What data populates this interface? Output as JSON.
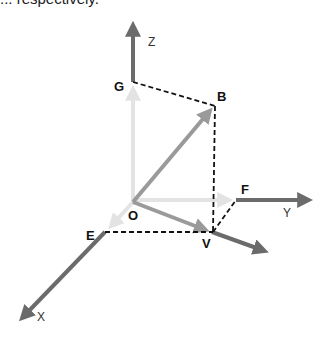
{
  "caption": "... respectively.",
  "diagram": {
    "type": "3d-coordinate-vector-diagram",
    "axes": [
      {
        "name": "X",
        "label": "X"
      },
      {
        "name": "Y",
        "label": "Y"
      },
      {
        "name": "Z",
        "label": "Z"
      }
    ],
    "points": {
      "O": "O",
      "G": "G",
      "B": "B",
      "F": "F",
      "V": "V",
      "E": "E"
    },
    "vectors": [
      "OB",
      "OV",
      "OG",
      "OF",
      "OE"
    ],
    "dashed_edges": [
      "GB",
      "BV",
      "EV",
      "VF"
    ],
    "colors": {
      "axis": "#6b6b6b",
      "component_vector": "#e6e6e6",
      "resultant_vector": "#9a9a9a",
      "dashed": "#111111"
    }
  }
}
